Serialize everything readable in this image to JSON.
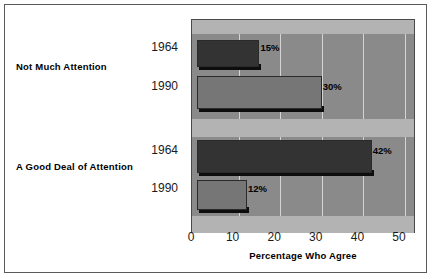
{
  "chart_data": {
    "type": "bar",
    "orientation": "horizontal",
    "title": "",
    "xlabel": "Percentage Who Agree",
    "ylabel": "",
    "xlim": [
      0,
      50
    ],
    "xticks": [
      "0",
      "10",
      "20",
      "30",
      "40",
      "50"
    ],
    "grid": true,
    "legend": "none",
    "categories": [
      "Not Much Attention",
      "A Good Deal of Attention"
    ],
    "groups": [
      {
        "category": "Not Much Attention",
        "bars": [
          {
            "year": "1964",
            "value": 15,
            "label": "15%",
            "color": "#333333"
          },
          {
            "year": "1990",
            "value": 30,
            "label": "30%",
            "color": "#767676"
          }
        ]
      },
      {
        "category": "A Good Deal of Attention",
        "bars": [
          {
            "year": "1964",
            "value": 42,
            "label": "42%",
            "color": "#333333"
          },
          {
            "year": "1990",
            "value": 12,
            "label": "12%",
            "color": "#767676"
          }
        ]
      }
    ],
    "series": [
      {
        "name": "1964",
        "values": [
          15,
          42
        ]
      },
      {
        "name": "1990",
        "values": [
          30,
          12
        ]
      }
    ],
    "colors": {
      "bar_1964": "#333333",
      "bar_1990": "#767676",
      "plot_background": "#8a8a8a",
      "band": "#b3b3b3",
      "gridline": "#d4d4d4",
      "frame": "#5a5a5a",
      "page_background": "#ffffff"
    }
  }
}
